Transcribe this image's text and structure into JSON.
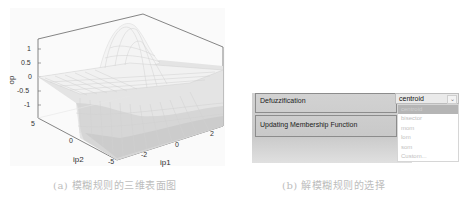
{
  "figure_a": {
    "caption": "(a) 模糊规则的三维表面图",
    "zlabel": "op",
    "xlabel": "ip1",
    "ylabel": "ip2",
    "z_ticks": [
      "1",
      "0.5",
      "0",
      "-0.5",
      "-1"
    ],
    "ip2_ticks": [
      "5",
      "0",
      "-5"
    ],
    "ip1_ticks": [
      "-2",
      "0",
      "2"
    ]
  },
  "figure_b": {
    "caption": "(b) 解模糊规则的选择",
    "defuzz_label": "Defuzzification",
    "defuzz_value": "centroid",
    "update_label": "Updating Membership Function",
    "options": [
      "centroid",
      "bisector",
      "mom",
      "lom",
      "som",
      "Custom..."
    ],
    "selected_index": 0
  }
}
